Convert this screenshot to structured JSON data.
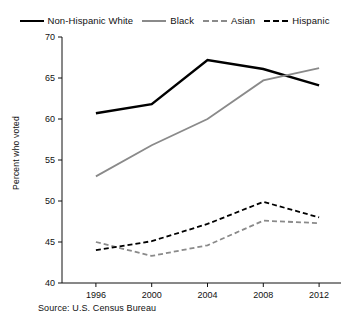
{
  "legend": {
    "entries": [
      {
        "label": "Non-Hispanic White",
        "style": "solid-thick",
        "color": "#000000"
      },
      {
        "label": "Black",
        "style": "solid-gray",
        "color": "#8a8a8a"
      },
      {
        "label": "Asian",
        "style": "dash-gray",
        "color": "#8a8a8a"
      },
      {
        "label": "Hispanic",
        "style": "dash-black",
        "color": "#000000"
      }
    ]
  },
  "axes": {
    "ylabel": "Percent who voted",
    "yticks": [
      "40",
      "45",
      "50",
      "55",
      "60",
      "65",
      "70"
    ],
    "xticks": [
      "1996",
      "2000",
      "2004",
      "2008",
      "2012"
    ]
  },
  "source": "Source: U.S. Census Bureau",
  "chart_data": {
    "type": "line",
    "title": "",
    "xlabel": "",
    "ylabel": "Percent who voted",
    "categories": [
      "1996",
      "2000",
      "2004",
      "2008",
      "2012"
    ],
    "x": [
      1996,
      2000,
      2004,
      2008,
      2012
    ],
    "ylim": [
      40,
      70
    ],
    "yticks": [
      40,
      45,
      50,
      55,
      60,
      65,
      70
    ],
    "grid": false,
    "legend_position": "top",
    "series": [
      {
        "name": "Non-Hispanic White",
        "values": [
          60.7,
          61.8,
          67.2,
          66.1,
          64.1
        ],
        "color": "#000000",
        "linestyle": "solid",
        "linewidth": 2.4
      },
      {
        "name": "Black",
        "values": [
          53.0,
          56.8,
          60.0,
          64.7,
          66.2
        ],
        "color": "#8a8a8a",
        "linestyle": "solid",
        "linewidth": 1.8
      },
      {
        "name": "Asian",
        "values": [
          45.0,
          43.3,
          44.6,
          47.6,
          47.3
        ],
        "color": "#8a8a8a",
        "linestyle": "dashed",
        "linewidth": 1.8
      },
      {
        "name": "Hispanic",
        "values": [
          44.0,
          45.1,
          47.2,
          49.9,
          48.0
        ],
        "color": "#000000",
        "linestyle": "dashed",
        "linewidth": 1.8
      }
    ],
    "annotations": [
      "Source: U.S. Census Bureau"
    ]
  }
}
